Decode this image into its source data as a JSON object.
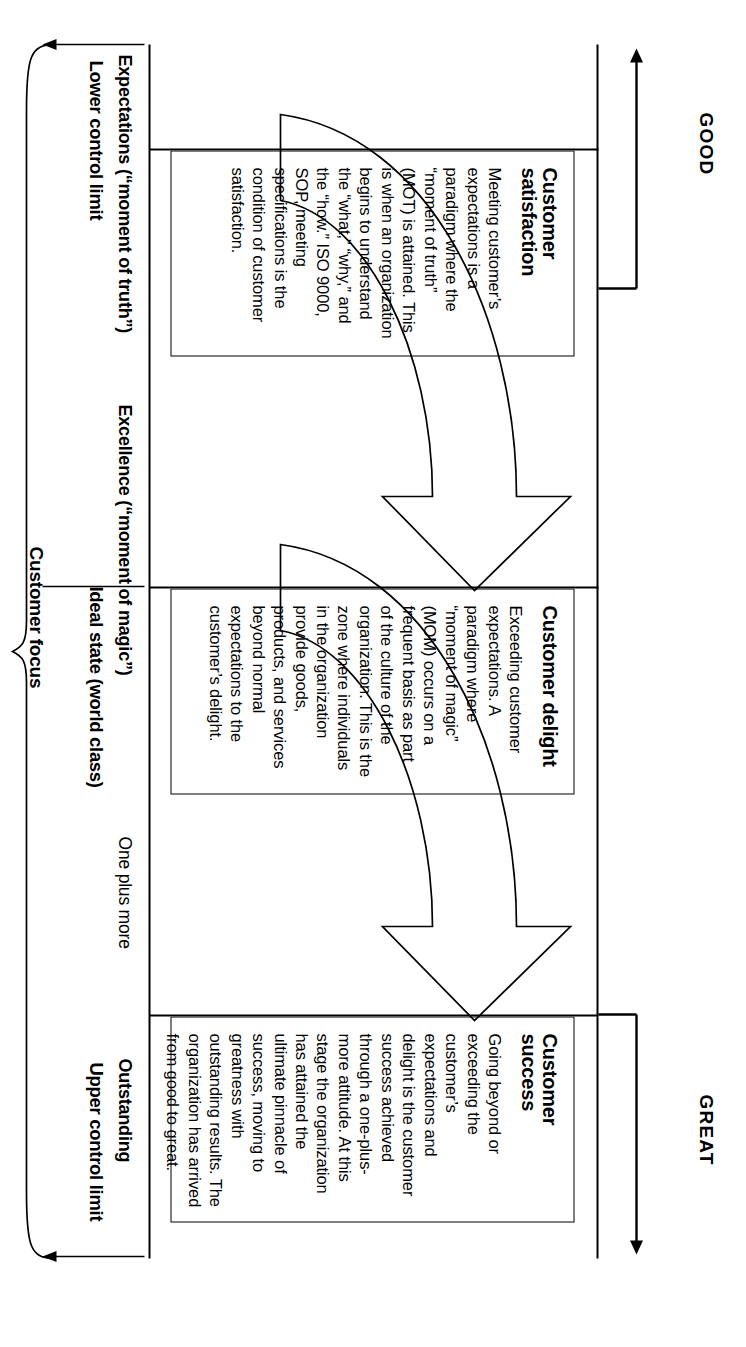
{
  "diagram": {
    "title_axis": {
      "good_label": "GOOD",
      "great_label": "GREAT"
    },
    "stages": [
      {
        "id": "customer-satisfaction",
        "title": "Customer satisfaction",
        "body": "Meeting customer’s expectations is a paradigm where the “moment of truth” (MOT) is attained. This is when an organization begins to understand the “what,” “why,” and the “how.” ISO 9000, SOP, meeting specifications is the condition of customer satisfaction."
      },
      {
        "id": "customer-delight",
        "title": "Customer delight",
        "body": "Exceeding customer expectations. A paradigm where “moment of  magic” (MOM) occurs on a frequent basis as part of the culture of the organization. This is the zone where individuals in the organization provide goods, products, and services beyond normal expectations to the customer’s delight."
      },
      {
        "id": "customer-success",
        "title": "Customer success",
        "body": "Going beyond or exceeding the customer’s expectations and delight is the customer success achieved through a one-plus-more attitude. At this stage the organization has attained the ultimate pinnacle of success, moving to greatness with outstanding results. The organization has arrived from good to great."
      }
    ],
    "band_labels": [
      {
        "id": "expectations",
        "text": "Expectations (“moment of truth”)",
        "weight": "bold"
      },
      {
        "id": "excellence",
        "text": "Excellence (“moment of magic”)",
        "weight": "bold"
      },
      {
        "id": "one-plus-more",
        "text": "One plus more",
        "weight": "normal"
      },
      {
        "id": "outstanding",
        "text": "Outstanding",
        "weight": "bold"
      }
    ],
    "control_limits": [
      {
        "id": "lower-control-limit",
        "text": "Lower control limit"
      },
      {
        "id": "ideal-state",
        "text": "Ideal state (world class)"
      },
      {
        "id": "upper-control-limit",
        "text": "Upper control limit"
      }
    ],
    "brace": {
      "label": "Customer focus"
    },
    "colors": {
      "line": "#000000",
      "background": "#ffffff",
      "text": "#000000"
    },
    "arrows": [
      {
        "id": "arrow-satisfaction-to-delight",
        "shape": "curved-block-arrow"
      },
      {
        "id": "arrow-delight-to-success",
        "shape": "curved-block-arrow"
      }
    ]
  }
}
